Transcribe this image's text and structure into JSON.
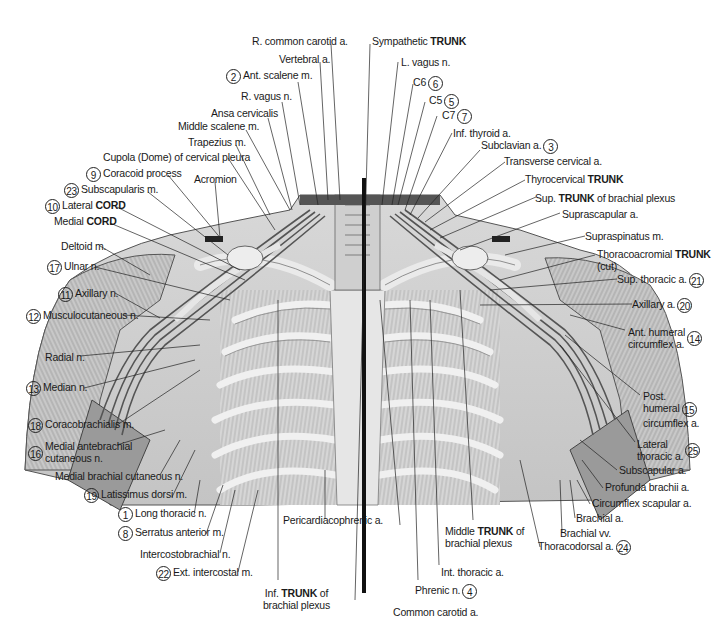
{
  "figure": {
    "type": "anatomical illustration",
    "colors": {
      "background": "#ffffff",
      "ink": "#1a1a1a",
      "tissue_light": "#e4e4e4",
      "tissue_mid": "#b8b8b8",
      "tissue_dark": "#5a5a5a",
      "midline_bar": "#111111"
    }
  },
  "labels": {
    "top": [
      {
        "id": "r_common_carotid",
        "text": "R. common carotid a."
      },
      {
        "id": "vertebral",
        "text": "Vertebral a."
      },
      {
        "id": "ant_scalene",
        "num": "2",
        "text": "Ant. scalene m."
      },
      {
        "id": "r_vagus",
        "text": "R. vagus n."
      },
      {
        "id": "ansa_cervicalis",
        "text": "Ansa cervicalis"
      },
      {
        "id": "middle_scalene",
        "text": "Middle scalene m."
      },
      {
        "id": "trapezius",
        "text": "Trapezius m."
      },
      {
        "id": "sympathetic_trunk",
        "pre": "Sympathetic ",
        "bold": "TRUNK",
        "post": ""
      },
      {
        "id": "l_vagus",
        "text": "L. vagus n."
      },
      {
        "id": "c6",
        "text": "C6",
        "num": "6"
      },
      {
        "id": "c5",
        "text": "C5",
        "num": "5"
      },
      {
        "id": "c7",
        "text": "C7",
        "num": "7"
      },
      {
        "id": "inf_thyroid",
        "text": "Inf. thyroid a."
      },
      {
        "id": "subclavian",
        "text": "Subclavian a.",
        "num": "3"
      }
    ],
    "left": [
      {
        "id": "cupola",
        "text": "Cupola (Dome) of cervical pleura"
      },
      {
        "id": "coracoid",
        "num": "9",
        "text": "Coracoid process"
      },
      {
        "id": "acromion",
        "text": "Acromion"
      },
      {
        "id": "subscapularis",
        "num": "23",
        "text": "Subscapularis m."
      },
      {
        "id": "lateral_cord",
        "num": "10",
        "pre": "Lateral ",
        "bold": "CORD",
        "post": ""
      },
      {
        "id": "medial_cord",
        "pre": "Medial ",
        "bold": "CORD",
        "post": ""
      },
      {
        "id": "deltoid",
        "text": "Deltoid m."
      },
      {
        "id": "ulnar",
        "num": "17",
        "text": "Ulnar n."
      },
      {
        "id": "axillary_n",
        "num": "11",
        "text": "Axillary n."
      },
      {
        "id": "musculocutaneous",
        "num": "12",
        "text": "Musculocutaneous n."
      },
      {
        "id": "radial",
        "text": "Radial n."
      },
      {
        "id": "median",
        "num": "13",
        "text": "Median n."
      },
      {
        "id": "coracobrachialis",
        "num": "18",
        "text": "Coracobrachialis m."
      },
      {
        "id": "med_antebrachial",
        "num": "16",
        "text": "Medial antebrachial cutaneous n."
      },
      {
        "id": "med_brachial",
        "text": "Medial brachial cutaneous n."
      },
      {
        "id": "latissimus",
        "num": "19",
        "text": "Latissimus dorsi m."
      },
      {
        "id": "long_thoracic",
        "num": "1",
        "text": "Long thoracic n."
      },
      {
        "id": "serratus",
        "num": "8",
        "text": "Serratus anterior m."
      },
      {
        "id": "intercostobrachial",
        "text": "Intercostobrachial n."
      },
      {
        "id": "ext_intercostal",
        "num": "22",
        "text": "Ext. intercostal m."
      }
    ],
    "bottom": [
      {
        "id": "inf_trunk",
        "pre": "Inf. ",
        "bold": "TRUNK",
        "post": " of brachial plexus"
      },
      {
        "id": "pericardiacophrenic",
        "text": "Pericardiacophrenic a."
      },
      {
        "id": "common_carotid",
        "text": "Common carotid a."
      },
      {
        "id": "phrenic",
        "text": "Phrenic n.",
        "num": "4"
      },
      {
        "id": "int_thoracic",
        "text": "Int. thoracic a."
      },
      {
        "id": "middle_trunk",
        "pre": "Middle ",
        "bold": "TRUNK",
        "post": " of brachial plexus"
      },
      {
        "id": "thoracodorsal",
        "text": "Thoracodorsal a.",
        "num": "24"
      },
      {
        "id": "brachial_vv",
        "text": "Brachial vv."
      },
      {
        "id": "brachial_a",
        "text": "Brachial a."
      }
    ],
    "right": [
      {
        "id": "transverse_cervical",
        "text": "Transverse cervical a."
      },
      {
        "id": "thyrocervical",
        "pre": "Thyrocervical ",
        "bold": "TRUNK",
        "post": ""
      },
      {
        "id": "sup_trunk",
        "pre": "Sup. ",
        "bold": "TRUNK",
        "post": " of brachial plexus"
      },
      {
        "id": "suprascapular",
        "text": "Suprascapular a."
      },
      {
        "id": "supraspinatus",
        "text": "Supraspinatus m."
      },
      {
        "id": "thoracoacromial",
        "pre": "Thoracoacromial ",
        "bold": "TRUNK",
        "post": "",
        "line2": "(cut)"
      },
      {
        "id": "sup_thoracic",
        "text": "Sup. thoracic a.",
        "num": "21"
      },
      {
        "id": "axillary_a",
        "text": "Axillary a.",
        "num": "20"
      },
      {
        "id": "ant_humeral",
        "text": "Ant. humeral",
        "line2": "circumflex a.",
        "num": "14"
      },
      {
        "id": "post_humeral",
        "text": "Post.",
        "line2": "humeral",
        "line3": "circumflex a.",
        "num": "15"
      },
      {
        "id": "lateral_thoracic",
        "text": "Lateral",
        "line2": "thoracic a.",
        "num": "25"
      },
      {
        "id": "subscapular_a",
        "text": "Subscapular a."
      },
      {
        "id": "profunda",
        "text": "Profunda brachii a."
      },
      {
        "id": "circumflex_scapular",
        "text": "Circumflex scapular a."
      }
    ]
  }
}
